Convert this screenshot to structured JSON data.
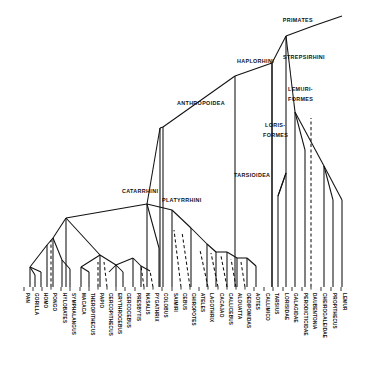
{
  "figure": {
    "type": "phylogenetic-tree",
    "root_label": "PRIMATES",
    "style": "cladogram with solid (known) and dashed (inferred) lineages"
  },
  "clades": [
    {
      "id": "primates",
      "label": "PRIMATES",
      "x": 313,
      "y": 22,
      "anchor": "end"
    },
    {
      "id": "strepsirhini",
      "label": "STREPSIRHINI",
      "x": 283,
      "y": 59,
      "anchor": "start"
    },
    {
      "id": "haplorhini",
      "label": "HAPLORHINI",
      "x": 237,
      "y": 63,
      "anchor": "start"
    },
    {
      "id": "lemuriformes_1",
      "label": "LEMURI-",
      "x": 288,
      "y": 91,
      "anchor": "start"
    },
    {
      "id": "lemuriformes_2",
      "label": "FORMES",
      "x": 288,
      "y": 101,
      "anchor": "start"
    },
    {
      "id": "anthropoidea",
      "label": "ANTHROPOIDEA",
      "x": 177,
      "y": 105,
      "anchor": "start"
    },
    {
      "id": "lorisiformes_1",
      "label": "LORIS-",
      "x": 265,
      "y": 127,
      "anchor": "start"
    },
    {
      "id": "lorisiformes_2",
      "label": "FORMES",
      "x": 263,
      "y": 137,
      "anchor": "start"
    },
    {
      "id": "tarsioidea",
      "label": "TARSIOIDEA",
      "x": 234,
      "y": 177,
      "anchor": "start"
    },
    {
      "id": "catarrhini",
      "label": "CATARRHINI",
      "x": 122,
      "y": 193,
      "anchor": "start"
    },
    {
      "id": "platyrrhini",
      "label": "PLATYRRHINI",
      "x": 162,
      "y": 202,
      "anchor": "start"
    }
  ],
  "taxa": [
    {
      "label": "PAN",
      "x": 24,
      "tip_y": 287,
      "dashed": false
    },
    {
      "label": "GORILLA",
      "x": 33,
      "tip_y": 287,
      "dashed": false
    },
    {
      "label": "HOMO",
      "x": 42,
      "tip_y": 287,
      "dashed": false
    },
    {
      "label": "PONGO",
      "x": 51,
      "tip_y": 287,
      "dashed": true
    },
    {
      "label": "HYLOBATES",
      "x": 61,
      "tip_y": 287,
      "dashed": false
    },
    {
      "label": "SYMPHALANGUS",
      "x": 70,
      "tip_y": 287,
      "dashed": false
    },
    {
      "label": "MACACA",
      "x": 80,
      "tip_y": 287,
      "dashed": false
    },
    {
      "label": "THEROPITHECUS",
      "x": 89,
      "tip_y": 287,
      "dashed": false
    },
    {
      "label": "PAPIO",
      "x": 98,
      "tip_y": 287,
      "dashed": true
    },
    {
      "label": "CERCOPITHECUS",
      "x": 107,
      "tip_y": 287,
      "dashed": true
    },
    {
      "label": "ERYTHROCEBUS",
      "x": 116,
      "tip_y": 287,
      "dashed": false
    },
    {
      "label": "CERCOCEBUS",
      "x": 125,
      "tip_y": 287,
      "dashed": false
    },
    {
      "label": "PRESBYTIS",
      "x": 135,
      "tip_y": 287,
      "dashed": false
    },
    {
      "label": "NASALIS",
      "x": 144,
      "tip_y": 287,
      "dashed": true
    },
    {
      "label": "PYGATHRIX",
      "x": 153,
      "tip_y": 287,
      "dashed": true
    },
    {
      "label": "COLOBUS",
      "x": 162,
      "tip_y": 287,
      "dashed": false
    },
    {
      "label": "SAIMIRI",
      "x": 172,
      "tip_y": 287,
      "dashed": false
    },
    {
      "label": "CEBUS",
      "x": 181,
      "tip_y": 287,
      "dashed": true
    },
    {
      "label": "CHIROPOTES",
      "x": 190,
      "tip_y": 287,
      "dashed": true
    },
    {
      "label": "ATELES",
      "x": 199,
      "tip_y": 287,
      "dashed": false
    },
    {
      "label": "LAGOTHRIX",
      "x": 208,
      "tip_y": 287,
      "dashed": true
    },
    {
      "label": "CACAJAO",
      "x": 218,
      "tip_y": 287,
      "dashed": true
    },
    {
      "label": "CALLICEBUS",
      "x": 227,
      "tip_y": 287,
      "dashed": true
    },
    {
      "label": "ALOUATTA",
      "x": 236,
      "tip_y": 287,
      "dashed": true
    },
    {
      "label": "OEDIPOMIDAS",
      "x": 245,
      "tip_y": 287,
      "dashed": true
    },
    {
      "label": "AOTES",
      "x": 254,
      "tip_y": 287,
      "dashed": false
    },
    {
      "label": "CALLIMICO",
      "x": 264,
      "tip_y": 287,
      "dashed": false
    },
    {
      "label": "TARSIUS",
      "x": 273,
      "tip_y": 287,
      "dashed": false
    },
    {
      "label": "LORISIDAE",
      "x": 283,
      "tip_y": 287,
      "dashed": false
    },
    {
      "label": "GALAGIDAE",
      "x": 292,
      "tip_y": 287,
      "dashed": false
    },
    {
      "label": "PERODICTICIDAE",
      "x": 302,
      "tip_y": 287,
      "dashed": false
    },
    {
      "label": "DAUBENTONIA",
      "x": 311,
      "tip_y": 287,
      "dashed": true
    },
    {
      "label": "CHEIROGALEIDAE",
      "x": 321,
      "tip_y": 287,
      "dashed": false
    },
    {
      "label": "PROPITHECUS",
      "x": 331,
      "tip_y": 287,
      "dashed": false
    },
    {
      "label": "LEMUR",
      "x": 341,
      "tip_y": 287,
      "dashed": false
    }
  ],
  "solid_paths": [
    "M 313 26 L 342 16",
    "M 313 26 L 286 36",
    "M 286 36 L 286 287",
    "M 286 36 L 272 63",
    "M 272 63 L 272 287",
    "M 272 63 L 235 76",
    "M 235 76 L 235 287",
    "M 235 76 L 163 127",
    "M 163 127 L 163 287",
    "M 163 127 L 160 128",
    "M 160 128 L 160 287",
    "M 160 128 L 147 204",
    "M 147 204 L 147 287",
    "M 147 204 L 66 218",
    "M 66 218 L 66 287",
    "M 66 218 L 53 238",
    "M 53 238 L 53 287",
    "M 53 238 L 47 245",
    "M 47 245 L 30 267",
    "M 30 267 L 30 287",
    "M 30 267 L 35 275",
    "M 35 275 L 35 287",
    "M 30 267 L 41 272",
    "M 41 272 L 41 287",
    "M 47 245 L 47 287",
    "M 53 238 L 62 260",
    "M 62 260 L 62 287",
    "M 62 260 L 70 269",
    "M 70 269 L 70 287",
    "M 66 218 L 100 255",
    "M 100 255 L 81 267",
    "M 81 267 L 81 287",
    "M 81 267 L 89 272",
    "M 89 272 L 89 287",
    "M 100 255 L 100 287",
    "M 100 255 L 116 265",
    "M 116 265 L 116 287",
    "M 116 265 L 109 272",
    "M 116 265 L 123 272",
    "M 123 272 L 123 287",
    "M 116 265 L 133 258",
    "M 133 258 L 133 287",
    "M 133 258 L 141 266",
    "M 141 266 L 141 287",
    "M 141 266 L 150 271",
    "M 147 204 L 159 248",
    "M 159 248 L 159 287",
    "M 147 204 L 172 210",
    "M 172 210 L 172 287",
    "M 172 210 L 191 228",
    "M 191 228 L 191 287",
    "M 191 228 L 207 244",
    "M 207 244 L 207 287",
    "M 207 244 L 216 252",
    "M 216 252 L 216 287",
    "M 216 252 L 227 252",
    "M 227 252 L 227 287",
    "M 227 252 L 237 258",
    "M 237 258 L 237 287",
    "M 237 258 L 247 258",
    "M 247 258 L 247 287",
    "M 247 258 L 256 266",
    "M 256 266 L 256 287",
    "M 272 63 L 272 287",
    "M 286 36 L 295 112",
    "M 295 112 L 295 287",
    "M 295 112 L 305 150",
    "M 305 150 L 305 287",
    "M 295 112 L 324 166",
    "M 324 166 L 324 287",
    "M 324 166 L 333 200",
    "M 333 200 L 333 287",
    "M 324 166 L 342 200",
    "M 342 200 L 342 287",
    "M 278 196 L 278 287",
    "M 278 196 L 286 173",
    "M 286 173 L 278 196"
  ],
  "dashed_paths": [
    "M 51 287 L 51 240",
    "M 98 287 L 98 262",
    "M 107 287 L 104 262",
    "M 144 287 L 141 266",
    "M 153 287 L 150 271",
    "M 181 287 L 174 230",
    "M 190 287 L 182 232",
    "M 208 287 L 200 250",
    "M 218 287 L 211 253",
    "M 227 287 L 221 256",
    "M 236 287 L 231 259",
    "M 245 287 L 241 262",
    "M 311 287 L 311 118"
  ]
}
